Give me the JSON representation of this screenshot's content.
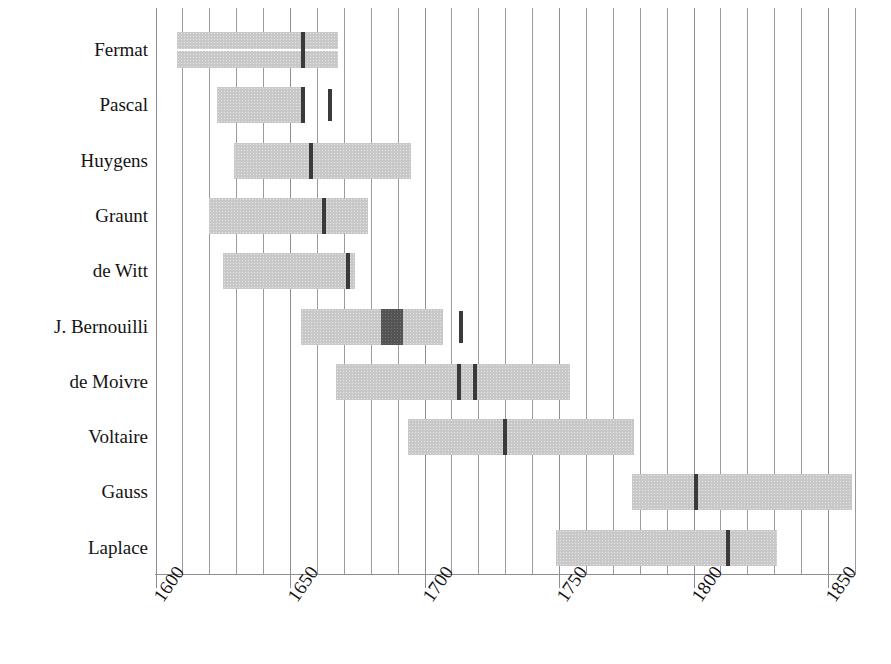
{
  "chart_data": {
    "type": "bar",
    "title": "",
    "subtitle": "",
    "xlabel": "",
    "ylabel": "",
    "orientation": "horizontal",
    "grid": true,
    "grid_interval": 10,
    "legend": null,
    "xlim": [
      1600,
      1860
    ],
    "xticks": [
      1600,
      1650,
      1700,
      1750,
      1800,
      1850
    ],
    "xtick_labels": [
      "1600",
      "1650",
      "1700",
      "1750",
      "1800",
      "1850"
    ],
    "xtick_rotation": -55,
    "categories": [
      "Fermat",
      "Pascal",
      "Huygens",
      "Graunt",
      "de Witt",
      "J. Bernouilli",
      "de Moivre",
      "Voltaire",
      "Gauss",
      "Laplace"
    ],
    "bar_color": "#c8c8c8",
    "marker_color": "#3a3a3a",
    "block_color": "#545454",
    "series": [
      {
        "name": "lifespan",
        "bars": [
          {
            "category": "Fermat",
            "start": 1608,
            "end": 1668,
            "split": true
          },
          {
            "category": "Pascal",
            "start": 1623,
            "end": 1654,
            "split": false
          },
          {
            "category": "Huygens",
            "start": 1629,
            "end": 1695,
            "split": false
          },
          {
            "category": "Graunt",
            "start": 1620,
            "end": 1679,
            "split": false
          },
          {
            "category": "de Witt",
            "start": 1625,
            "end": 1674,
            "split": false
          },
          {
            "category": "J. Bernouilli",
            "start": 1654,
            "end": 1707,
            "split": false
          },
          {
            "category": "de Moivre",
            "start": 1667,
            "end": 1754,
            "split": false
          },
          {
            "category": "Voltaire",
            "start": 1694,
            "end": 1778,
            "split": false
          },
          {
            "category": "Gauss",
            "start": 1777,
            "end": 1859,
            "split": false
          },
          {
            "category": "Laplace",
            "start": 1749,
            "end": 1831,
            "split": false
          }
        ]
      }
    ],
    "markers": [
      {
        "category": "Fermat",
        "year": 1654,
        "kind": "line"
      },
      {
        "category": "Pascal",
        "year": 1654,
        "kind": "line"
      },
      {
        "category": "Pascal",
        "year": 1664,
        "kind": "standalone"
      },
      {
        "category": "Huygens",
        "year": 1657,
        "kind": "line"
      },
      {
        "category": "Graunt",
        "year": 1662,
        "kind": "line"
      },
      {
        "category": "de Witt",
        "year": 1671,
        "kind": "line"
      },
      {
        "category": "J. Bernouilli",
        "year": 1684,
        "kind": "block",
        "year_end": 1692
      },
      {
        "category": "J. Bernouilli",
        "year": 1713,
        "kind": "standalone"
      },
      {
        "category": "de Moivre",
        "year": 1712,
        "kind": "line"
      },
      {
        "category": "de Moivre",
        "year": 1718,
        "kind": "line"
      },
      {
        "category": "Voltaire",
        "year": 1729,
        "kind": "line"
      },
      {
        "category": "Gauss",
        "year": 1800,
        "kind": "line"
      },
      {
        "category": "Laplace",
        "year": 1812,
        "kind": "line"
      }
    ]
  },
  "axis": {
    "tick_labels": [
      "1600",
      "1650",
      "1700",
      "1750",
      "1800",
      "1850"
    ]
  },
  "rows": {
    "labels": [
      "Fermat",
      "Pascal",
      "Huygens",
      "Graunt",
      "de Witt",
      "J. Bernouilli",
      "de Moivre",
      "Voltaire",
      "Gauss",
      "Laplace"
    ]
  }
}
